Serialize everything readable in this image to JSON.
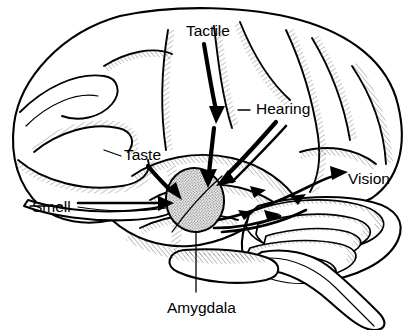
{
  "figure": {
    "type": "anatomical-diagram",
    "width": 419,
    "height": 330,
    "background_color": "#ffffff",
    "line_color": "#000000",
    "structure_fill": "#ffffff",
    "amygdala_fill": "#c9c9c9"
  },
  "labels": {
    "tactile": {
      "text": "Tactile",
      "x": 186,
      "y": 36,
      "anchor": "start",
      "role": "sensory-modality"
    },
    "hearing": {
      "text": "Hearing",
      "x": 256,
      "y": 114,
      "anchor": "start",
      "role": "sensory-modality"
    },
    "taste": {
      "text": "Taste",
      "x": 124,
      "y": 160,
      "anchor": "start",
      "role": "sensory-modality"
    },
    "smell": {
      "text": "Smell",
      "x": 32,
      "y": 212,
      "anchor": "start",
      "role": "sensory-modality"
    },
    "vision": {
      "text": "Vision",
      "x": 348,
      "y": 184,
      "anchor": "start",
      "role": "sensory-modality"
    },
    "amygdala": {
      "text": "Amygdala",
      "x": 167,
      "y": 313,
      "anchor": "start",
      "role": "brain-structure"
    }
  },
  "structures": {
    "cerebrum": "cerebral-cortex-lateral",
    "cerebellum": "cerebellum",
    "brainstem": "brainstem",
    "temporal_lobe": "temporal-lobe",
    "amygdala": {
      "name": "amygdala",
      "center_x": 195,
      "center_y": 200,
      "radius_x": 29,
      "radius_y": 32,
      "fill": "#c9c9c9",
      "texture": "stippled"
    }
  },
  "pathways": [
    {
      "name": "tactile-pathway",
      "from": "Tactile",
      "to": "Amygdala",
      "direction": "down"
    },
    {
      "name": "hearing-pathway",
      "from": "Hearing",
      "to": "Amygdala",
      "direction": "down-left"
    },
    {
      "name": "taste-pathway",
      "from": "Taste",
      "to": "Amygdala",
      "direction": "down-right"
    },
    {
      "name": "smell-pathway",
      "from": "Smell",
      "to": "Amygdala",
      "direction": "right"
    },
    {
      "name": "vision-pathway",
      "from": "Amygdala",
      "to": "Vision",
      "direction": "right"
    }
  ]
}
